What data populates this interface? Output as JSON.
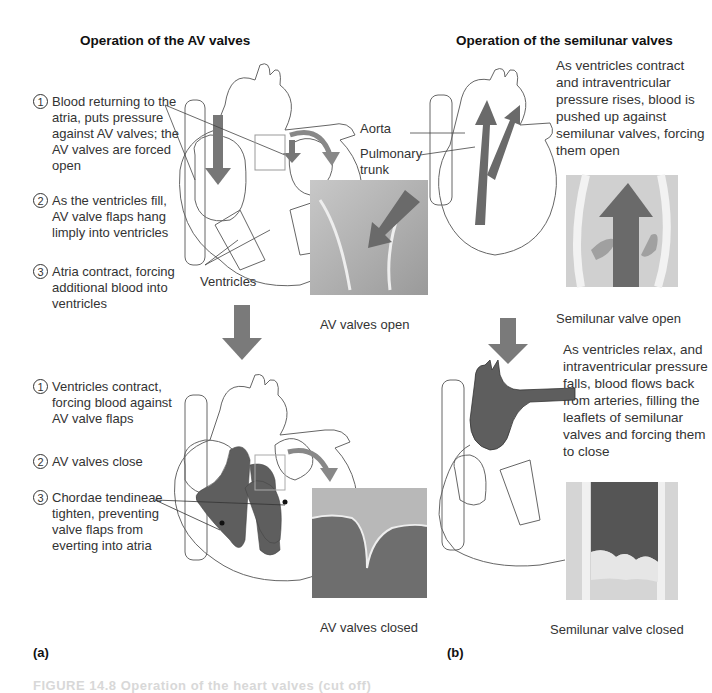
{
  "panel_a": {
    "title": "Operation of the AV valves",
    "label": "(a)",
    "top_steps": [
      {
        "num": "1",
        "text": "Blood returning to the atria, puts pressure against AV valves; the AV valves are forced open"
      },
      {
        "num": "2",
        "text": "As the ventricles fill, AV valve flaps hang limply into ventricles"
      },
      {
        "num": "3",
        "text": "Atria contract, forcing additional blood into ventricles"
      }
    ],
    "ventricles_label": "Ventricles",
    "top_caption": "AV valves open",
    "bottom_steps": [
      {
        "num": "1",
        "text": "Ventricles contract, forcing blood against AV valve flaps"
      },
      {
        "num": "2",
        "text": "AV valves close"
      },
      {
        "num": "3",
        "text": "Chordae tendineae tighten, preventing valve flaps from everting into atria"
      }
    ],
    "bottom_caption": "AV valves closed"
  },
  "panel_b": {
    "title": "Operation of the semilunar valves",
    "label": "(b)",
    "top_text": "As ventricles contract and intraventricular pressure rises, blood is pushed up against semilunar valves, forcing them open",
    "aorta_label": "Aorta",
    "pulmonary_label": "Pulmonary trunk",
    "top_caption": "Semilunar valve open",
    "bottom_text": "As ventricles relax, and intraventricular pressure falls, blood flows back from arteries, filling the leaflets of semilunar valves and forcing them to close",
    "bottom_caption": "Semilunar valve closed"
  },
  "footer": {
    "text": "FIGURE 14.8 Operation of the heart valves (cut off)"
  },
  "colors": {
    "blood_dark": "#5a5a5a",
    "arrow_gray": "#7a7a7a",
    "line": "#555555",
    "background": "#ffffff"
  }
}
